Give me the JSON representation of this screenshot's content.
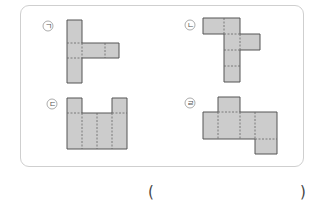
{
  "problem": {
    "nets": [
      {
        "label": "ㄱ",
        "name": "net-giyeok"
      },
      {
        "label": "ㄴ",
        "name": "net-nieun"
      },
      {
        "label": "ㄷ",
        "name": "net-digeut"
      },
      {
        "label": "ㄹ",
        "name": "net-rieul"
      }
    ],
    "answer_open": "(",
    "answer_close": ")",
    "answer_value": ""
  },
  "colors": {
    "face_fill": "#cccccc",
    "edge": "#555555",
    "fold": "#666666",
    "border": "#cfcfcf"
  }
}
